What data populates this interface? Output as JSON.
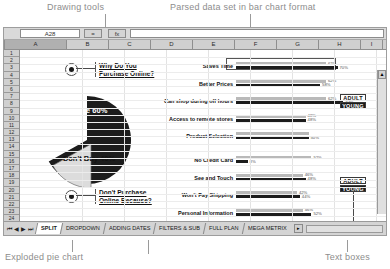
{
  "annotations": {
    "drawing_tools": "Drawing tools",
    "parsed_data": "Parsed data set in bar chart format",
    "exploded_pie": "Exploded pie chart",
    "text_boxes": "Text boxes"
  },
  "formula_bar": {
    "name_box": "A28",
    "equals_btn": "=",
    "fx_btn": "fx",
    "input_value": ""
  },
  "columns": [
    "A",
    "B",
    "C",
    "D",
    "E",
    "F",
    "G",
    "H",
    "I",
    "J"
  ],
  "selected_column": "A",
  "rows": [
    1,
    2,
    3,
    4,
    5,
    6,
    7,
    8,
    9,
    10,
    11,
    12,
    13,
    14,
    15,
    16,
    17,
    18,
    19,
    20,
    21,
    22,
    23,
    24
  ],
  "scrollbar": {
    "up_arrow": "▲",
    "down_arrow": "▼"
  },
  "questions": [
    {
      "id": "q1",
      "line1": "Why Do You",
      "line2": "Purchase Online?"
    },
    {
      "id": "q2",
      "line1": "Don't Purchase",
      "line2": "Online Because?"
    }
  ],
  "pie_chart": {
    "slices": [
      {
        "label": "Buy Online",
        "value": "60%",
        "percent": 60,
        "color": "#1c1c1c",
        "text_color": "#ffffff"
      },
      {
        "label": "Don't Buy",
        "value": "40%",
        "percent": 40,
        "color": "#dcdcdc",
        "text_color": "#111111"
      }
    ]
  },
  "legend": [
    {
      "label": "ADULT",
      "style": "adult"
    },
    {
      "label": "YOUNG",
      "style": "young"
    }
  ],
  "chart_data": [
    {
      "type": "bar",
      "title": "Why Do You Purchase Online?",
      "orientation": "horizontal",
      "categories": [
        "Saves Time",
        "Better Prices",
        "Can shop during off hours",
        "Access to remote stores",
        "Product Selection"
      ],
      "series": [
        {
          "name": "ADULT",
          "values": [
            62,
            62,
            62,
            48,
            50
          ]
        },
        {
          "name": "YOUNG",
          "values": [
            70,
            58,
            74,
            48,
            50
          ]
        }
      ],
      "value_labels": {
        "ADULT": [
          "62%",
          "62%",
          "62%",
          "48%",
          ""
        ],
        "YOUNG": [
          "70%",
          "58%",
          "74%",
          "48%",
          "50%"
        ]
      },
      "xlabel": "",
      "ylabel": "",
      "xlim": [
        0,
        100
      ],
      "grid": false,
      "legend_position": "right"
    },
    {
      "type": "bar",
      "title": "Don't Purchase Online Because?",
      "orientation": "horizontal",
      "categories": [
        "No Credit Card",
        "See and Touch",
        "Won't Pay Shipping",
        "Personal Information",
        "Security"
      ],
      "series": [
        {
          "name": "ADULT",
          "values": [
            52,
            46,
            42,
            46,
            26
          ]
        },
        {
          "name": "YOUNG",
          "values": [
            8,
            48,
            44,
            52,
            60
          ]
        }
      ],
      "value_labels": {
        "ADULT": [
          "52%",
          "46%",
          "42%",
          "46%",
          "26%"
        ],
        "YOUNG": [
          "8%",
          "48%",
          "44%",
          "52%",
          "60%"
        ]
      },
      "xlabel": "",
      "ylabel": "",
      "xlim": [
        0,
        100
      ],
      "grid": false,
      "legend_position": "right"
    }
  ],
  "tab_bar": {
    "nav_first": "⏮",
    "nav_prev": "◀",
    "nav_next": "▶",
    "nav_last": "⏭",
    "tabs": [
      {
        "label": "SPLIT",
        "active": true
      },
      {
        "label": "DROPDOWN",
        "active": false
      },
      {
        "label": "ADDING DATES",
        "active": false
      },
      {
        "label": "FILTERS & SUB",
        "active": false
      },
      {
        "label": "FULL PLAN",
        "active": false
      },
      {
        "label": "MEGA METRIX",
        "active": false
      }
    ],
    "spinner": "▸"
  }
}
